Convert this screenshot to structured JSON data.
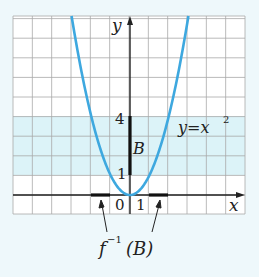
{
  "figure": {
    "function_label": "y=x",
    "function_exponent": "2",
    "axis_x_label": "x",
    "axis_y_label": "y",
    "tick_labels": {
      "origin": "0",
      "x_one": "1",
      "y_one": "1",
      "y_four": "4"
    },
    "set_label": "B",
    "preimage_label": {
      "f": "f",
      "exp": "−1",
      "arg": "(B)"
    }
  },
  "colors": {
    "background": "#eef8fb",
    "grid_bg": "#ffffff",
    "grid_line": "#9a9a9a",
    "band": "#dcf3f8",
    "curve": "#3ea8df",
    "axis": "#222222"
  },
  "chart_data": {
    "type": "line",
    "title": "",
    "function": "y = x^2",
    "xlabel": "x",
    "ylabel": "y",
    "xlim": [
      -6,
      6
    ],
    "ylim": [
      -1,
      9.2
    ],
    "grid": true,
    "series": [
      {
        "name": "y=x^2",
        "x": [
          -3,
          -2,
          -1,
          0,
          1,
          2,
          3
        ],
        "y": [
          9,
          4,
          1,
          0,
          1,
          4,
          9
        ]
      }
    ],
    "highlight_band_y": [
      1,
      4
    ],
    "set_B": [
      1,
      4
    ],
    "preimage_intervals": [
      [
        -2,
        -1
      ],
      [
        1,
        2
      ]
    ],
    "annotations": [
      "B",
      "f^-1(B)",
      "y=x^2"
    ]
  }
}
